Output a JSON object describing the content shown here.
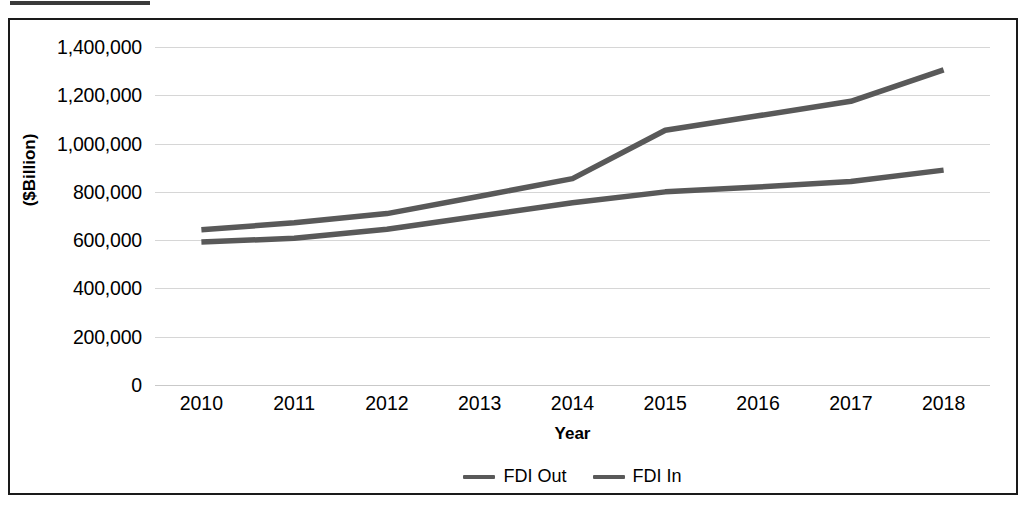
{
  "figure": {
    "clipped_caption_present": true,
    "frame_color": "#1a1a1a",
    "background": "#ffffff"
  },
  "chart_data": {
    "type": "line",
    "title": "",
    "xlabel": "Year",
    "ylabel": "($Billion)",
    "categories": [
      "2010",
      "2011",
      "2012",
      "2013",
      "2014",
      "2015",
      "2016",
      "2017",
      "2018"
    ],
    "x": [
      2010,
      2011,
      2012,
      2013,
      2014,
      2015,
      2016,
      2017,
      2018
    ],
    "series": [
      {
        "name": "FDI Out",
        "color": "#595959",
        "values": [
          643000,
          672000,
          710000,
          782000,
          855000,
          1055000,
          1115000,
          1175000,
          1305000
        ]
      },
      {
        "name": "FDI In",
        "color": "#595959",
        "values": [
          592000,
          608000,
          645000,
          700000,
          755000,
          800000,
          820000,
          843000,
          890000
        ]
      }
    ],
    "ylim": [
      0,
      1400000
    ],
    "yticks": [
      0,
      200000,
      400000,
      600000,
      800000,
      1000000,
      1200000,
      1400000
    ],
    "ytick_labels": [
      "0",
      "200,000",
      "400,000",
      "600,000",
      "800,000",
      "1,000,000",
      "1,200,000",
      "1,400,000"
    ],
    "grid": true,
    "grid_color": "#d6d6d6",
    "legend_position": "bottom",
    "legend": [
      "FDI Out",
      "FDI In"
    ]
  }
}
